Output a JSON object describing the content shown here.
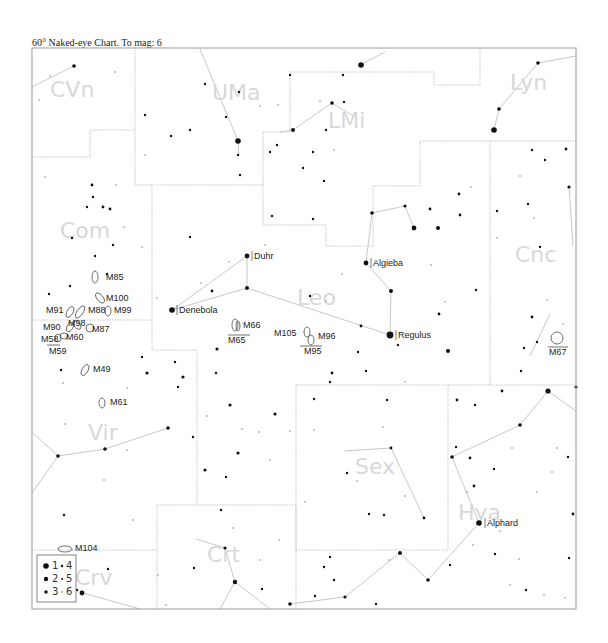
{
  "chart": {
    "title": "60° Naked-eye Chart. To mag: 6",
    "frame": {
      "x": 32,
      "y": 48,
      "width": 544,
      "height": 561
    },
    "colors": {
      "frame": "#999999",
      "boundary": "#bbbbbb",
      "stick": "#c8c8c8",
      "star": "#111111",
      "label": "#222222",
      "constellation_label": "#d8d8d8"
    }
  },
  "constellations": [
    {
      "abbr": "CVn",
      "x": 50,
      "y": 97
    },
    {
      "abbr": "UMa",
      "x": 212,
      "y": 100
    },
    {
      "abbr": "LMi",
      "x": 328,
      "y": 128
    },
    {
      "abbr": "Lyn",
      "x": 510,
      "y": 90
    },
    {
      "abbr": "Com",
      "x": 60,
      "y": 238
    },
    {
      "abbr": "Leo",
      "x": 297,
      "y": 305
    },
    {
      "abbr": "Cnc",
      "x": 515,
      "y": 262
    },
    {
      "abbr": "Vir",
      "x": 88,
      "y": 440
    },
    {
      "abbr": "Sex",
      "x": 355,
      "y": 474
    },
    {
      "abbr": "Hya",
      "x": 458,
      "y": 520
    },
    {
      "abbr": "Crt",
      "x": 207,
      "y": 562
    },
    {
      "abbr": "Crv",
      "x": 75,
      "y": 585
    }
  ],
  "named_stars": [
    {
      "name": "Duhr",
      "x": 247,
      "y": 256
    },
    {
      "name": "Algieba",
      "x": 366,
      "y": 263
    },
    {
      "name": "Denebola",
      "x": 172,
      "y": 310
    },
    {
      "name": "Regulus",
      "x": 390,
      "y": 335
    },
    {
      "name": "Alphard",
      "x": 479,
      "y": 523
    }
  ],
  "deep_sky": [
    {
      "id": "M85",
      "x": 95,
      "y": 277,
      "lx": 106,
      "ly": 280
    },
    {
      "id": "M100",
      "x": 100,
      "y": 298,
      "lx": 106,
      "ly": 301
    },
    {
      "id": "M91",
      "x": 70,
      "y": 311,
      "lx": 46,
      "ly": 313
    },
    {
      "id": "M88",
      "x": 80,
      "y": 311,
      "lx": 88,
      "ly": 313
    },
    {
      "id": "M99",
      "x": 108,
      "y": 311,
      "lx": 114,
      "ly": 313
    },
    {
      "id": "M90",
      "x": 68,
      "y": 326,
      "lx": 43,
      "ly": 330
    },
    {
      "id": "M98",
      "x": 75,
      "y": 325,
      "lx": 68,
      "ly": 326
    },
    {
      "id": "M87",
      "x": 88,
      "y": 328,
      "lx": 92,
      "ly": 332
    },
    {
      "id": "M58",
      "x": 57,
      "y": 338,
      "lx": 41,
      "ly": 342
    },
    {
      "id": "M60",
      "x": 63,
      "y": 337,
      "lx": 66,
      "ly": 340
    },
    {
      "id": "M59",
      "x": 58,
      "y": 350,
      "lx": 49,
      "ly": 354
    },
    {
      "id": "M49",
      "x": 85,
      "y": 370,
      "lx": 93,
      "ly": 372
    },
    {
      "id": "M61",
      "x": 102,
      "y": 402,
      "lx": 110,
      "ly": 405
    },
    {
      "id": "M66",
      "x": 237,
      "y": 325,
      "lx": 243,
      "ly": 328
    },
    {
      "id": "M65",
      "x": 235,
      "y": 330,
      "lx": 228,
      "ly": 343
    },
    {
      "id": "M105",
      "x": 307,
      "y": 333,
      "lx": 274,
      "ly": 336
    },
    {
      "id": "M96",
      "x": 310,
      "y": 335,
      "lx": 318,
      "ly": 339
    },
    {
      "id": "M95",
      "x": 311,
      "y": 340,
      "lx": 304,
      "ly": 354
    },
    {
      "id": "M67",
      "x": 557,
      "y": 338,
      "lx": 549,
      "ly": 355
    },
    {
      "id": "M104",
      "x": 65,
      "y": 549,
      "lx": 75,
      "ly": 551
    }
  ],
  "legend": {
    "items": [
      {
        "mag": "1"
      },
      {
        "mag": "2"
      },
      {
        "mag": "3"
      },
      {
        "mag": "4"
      },
      {
        "mag": "5"
      },
      {
        "mag": "6"
      }
    ]
  }
}
